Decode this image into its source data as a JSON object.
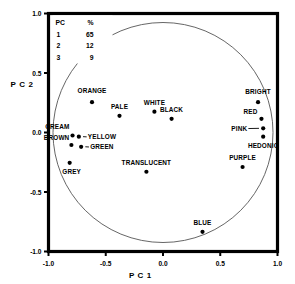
{
  "chart_data": {
    "type": "scatter",
    "title": "",
    "xlabel": "P C 1",
    "ylabel": "P C 2",
    "xlim": [
      -1.0,
      1.0
    ],
    "ylim": [
      -1.0,
      1.0
    ],
    "xticks": [
      "-1.0",
      "-0.5",
      "0.0",
      "0.5",
      "1.0"
    ],
    "xtick_values": [
      -1.0,
      -0.5,
      0.0,
      0.5,
      1.0
    ],
    "yticks": [
      "1.0",
      "0.5",
      "0.0",
      "-0.5",
      "-1.0"
    ],
    "ytick_values": [
      1.0,
      0.5,
      0.0,
      -0.5,
      -1.0
    ],
    "grid": false,
    "unit_circle": true,
    "legend_position": "top-left",
    "points": [
      {
        "label": "ORANGE",
        "x": -0.62,
        "y": 0.255,
        "label_dx": 0,
        "label_dy": -9,
        "anchor": "middle"
      },
      {
        "label": "PALE",
        "x": -0.38,
        "y": 0.14,
        "label_dx": 0,
        "label_dy": -7,
        "anchor": "middle"
      },
      {
        "label": "WHITE",
        "x": -0.075,
        "y": 0.175,
        "label_dx": 0,
        "label_dy": -7,
        "anchor": "middle"
      },
      {
        "label": "BLACK",
        "x": 0.075,
        "y": 0.115,
        "label_dx": 0,
        "label_dy": -7,
        "anchor": "middle"
      },
      {
        "label": "BRIGHT",
        "x": 0.83,
        "y": 0.255,
        "label_dx": 0,
        "label_dy": -8,
        "anchor": "middle"
      },
      {
        "label": "RED",
        "x": 0.86,
        "y": 0.115,
        "label_dx": -4,
        "label_dy": -5,
        "anchor": "end"
      },
      {
        "label": "PINK",
        "x": 0.875,
        "y": 0.035,
        "label_dx": -16,
        "label_dy": 2.4,
        "anchor": "end",
        "leader": true
      },
      {
        "label": "HEDONIC",
        "x": 0.875,
        "y": -0.035,
        "label_dx": 0,
        "label_dy": 11,
        "anchor": "middle"
      },
      {
        "label": "CREAM",
        "x": -0.79,
        "y": -0.025,
        "label_dx": -3,
        "label_dy": -6,
        "anchor": "end"
      },
      {
        "label": "YELLOW",
        "x": -0.735,
        "y": -0.035,
        "label_dx": 9,
        "label_dy": 2.4,
        "anchor": "start",
        "leader": true
      },
      {
        "label": "BROWN",
        "x": -0.8,
        "y": -0.105,
        "label_dx": -2,
        "label_dy": -5,
        "anchor": "end"
      },
      {
        "label": "GREEN",
        "x": -0.715,
        "y": -0.12,
        "label_dx": 9,
        "label_dy": 2.4,
        "anchor": "start",
        "leader": true
      },
      {
        "label": "GREY",
        "x": -0.815,
        "y": -0.255,
        "label_dx": 2,
        "label_dy": 11,
        "anchor": "middle"
      },
      {
        "label": "TRANSLUCENT",
        "x": -0.145,
        "y": -0.33,
        "label_dx": 0,
        "label_dy": -7,
        "anchor": "middle"
      },
      {
        "label": "PURPLE",
        "x": 0.695,
        "y": -0.29,
        "label_dx": 0,
        "label_dy": -7,
        "anchor": "middle"
      },
      {
        "label": "BLUE",
        "x": 0.345,
        "y": -0.835,
        "label_dx": 0,
        "label_dy": -7,
        "anchor": "middle"
      }
    ]
  },
  "legend": {
    "header_component": "PC",
    "header_percent": "%",
    "rows": [
      {
        "component": "1",
        "percent": "65"
      },
      {
        "component": "2",
        "percent": "12"
      },
      {
        "component": "3",
        "percent": "9"
      }
    ]
  }
}
